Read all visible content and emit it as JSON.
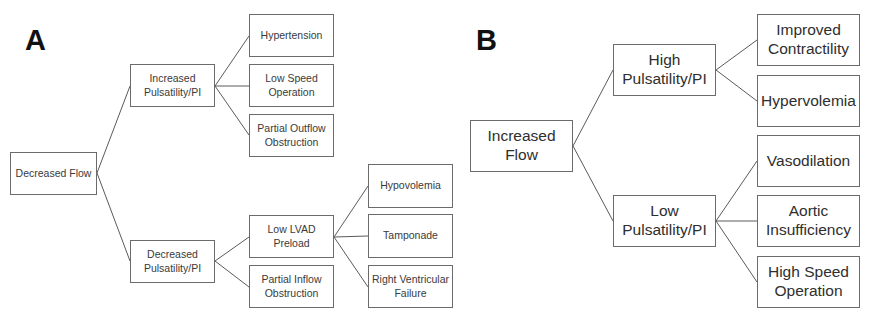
{
  "panels": {
    "a": {
      "label": "A",
      "root": "Decreased Flow",
      "level1": [
        "Increased\nPulsatility/PI",
        "Decreased\nPulsatility/PI"
      ],
      "level2": [
        "Hypertension",
        "Low Speed\nOperation",
        "Partial Outflow\nObstruction",
        "Low LVAD\nPreload",
        "Partial Inflow\nObstruction"
      ],
      "level3": [
        "Hypovolemia",
        "Tamponade",
        "Right Ventricular\nFailure"
      ]
    },
    "b": {
      "label": "B",
      "root": "Increased\nFlow",
      "level1": [
        "High\nPulsatility/PI",
        "Low\nPulsatility/PI"
      ],
      "level2": [
        "Improved\nContractility",
        "Hypervolemia",
        "Vasodilation",
        "Aortic\nInsufficiency",
        "High Speed\nOperation"
      ]
    }
  },
  "colors": {
    "border": "#6b6b6b",
    "line": "#555555",
    "label": "#111111"
  }
}
